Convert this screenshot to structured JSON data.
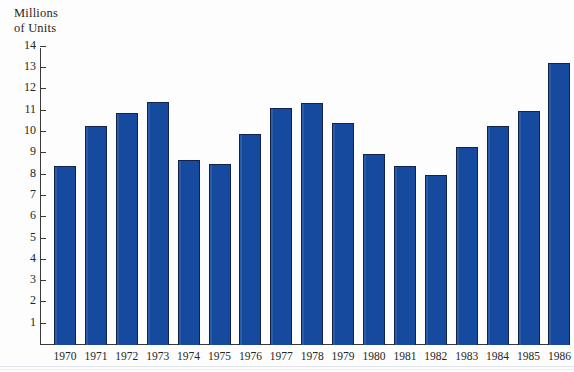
{
  "figure": {
    "axis_title_line1": "Millions",
    "axis_title_line2": "of Units",
    "bar_color": "#164a9e",
    "bar_outline_color": "#12224a",
    "background_color": "#fdfdfd",
    "text_color": "#262626"
  },
  "chart_data": {
    "type": "bar",
    "title": "",
    "subtitle": "",
    "xlabel": "",
    "ylabel": "Millions of Units",
    "ylim": [
      0,
      14
    ],
    "yticks": [
      1,
      2,
      3,
      4,
      5,
      6,
      7,
      8,
      9,
      10,
      11,
      12,
      13,
      14
    ],
    "ytick_labels": [
      "1",
      "2",
      "3",
      "4",
      "5",
      "6",
      "7",
      "8",
      "9",
      "10",
      "11",
      "12",
      "13",
      "14"
    ],
    "grid": false,
    "legend": null,
    "categories": [
      "1970",
      "1971",
      "1972",
      "1973",
      "1974",
      "1975",
      "1976",
      "1977",
      "1978",
      "1979",
      "1980",
      "1981",
      "1982",
      "1983",
      "1984",
      "1985",
      "1986"
    ],
    "values": [
      8.4,
      10.3,
      10.9,
      11.4,
      8.7,
      8.5,
      9.9,
      11.15,
      11.35,
      10.4,
      8.95,
      8.4,
      8.0,
      9.3,
      10.3,
      11.0,
      13.25
    ],
    "series": [
      {
        "name": "Units",
        "values": [
          8.4,
          10.3,
          10.9,
          11.4,
          8.7,
          8.5,
          9.9,
          11.15,
          11.35,
          10.4,
          8.95,
          8.4,
          8.0,
          9.3,
          10.3,
          11.0,
          13.25
        ]
      }
    ],
    "annotations": []
  }
}
